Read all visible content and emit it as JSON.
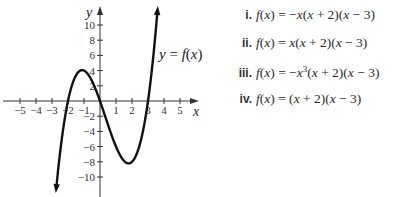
{
  "chart_data": {
    "type": "line",
    "title": "",
    "xlabel": "x",
    "ylabel": "y",
    "curve_label": "y = f(x)",
    "xlim": [
      -5.5,
      5.8
    ],
    "ylim": [
      -12,
      12
    ],
    "x_ticks": [
      -5,
      -4,
      -3,
      -2,
      -1,
      1,
      2,
      3,
      4,
      5
    ],
    "x_tick_labels": [
      "−5",
      "−4",
      "−3",
      "−2",
      "−1",
      "1",
      "2",
      "3",
      "4",
      "5"
    ],
    "y_ticks": [
      10,
      8,
      6,
      4,
      2,
      -2,
      -4,
      -6,
      -8,
      -10
    ],
    "y_tick_labels": [
      "10",
      "8",
      "6",
      "4",
      "2",
      "−2",
      "−4",
      "−6",
      "−8",
      "−10"
    ],
    "grid": false,
    "series": [
      {
        "name": "y = f(x)",
        "function": "x(x + 2)(x - 3)",
        "x": [
          -2.8,
          -2.5,
          -2,
          -1.5,
          -1,
          -0.5,
          0,
          0.5,
          1,
          1.5,
          1.79,
          2,
          2.5,
          3,
          3.3,
          3.6
        ],
        "values": [
          -12.99,
          -6.88,
          0,
          3.38,
          4,
          2.63,
          0,
          -3.13,
          -6,
          -7.88,
          -8.21,
          -8,
          -5.63,
          0,
          4.99,
          12.1
        ]
      }
    ],
    "features": {
      "x_intercepts": [
        -2,
        0,
        3
      ],
      "local_max": [
        -1,
        4
      ],
      "local_min": [
        1.79,
        -8.21
      ],
      "end_arrows": true
    }
  },
  "choices": [
    {
      "num": "i.",
      "prefix": "f(x) = ",
      "expr": "−x(x + 2)(x − 3)"
    },
    {
      "num": "ii.",
      "prefix": "f(x) = ",
      "expr": "x(x + 2)(x − 3)"
    },
    {
      "num": "iii.",
      "prefix": "f(x) = ",
      "expr": "−x³(x + 2)(x − 3)"
    },
    {
      "num": "iv.",
      "prefix": "f(x) = ",
      "expr": "(x + 2)(x − 3)"
    }
  ]
}
